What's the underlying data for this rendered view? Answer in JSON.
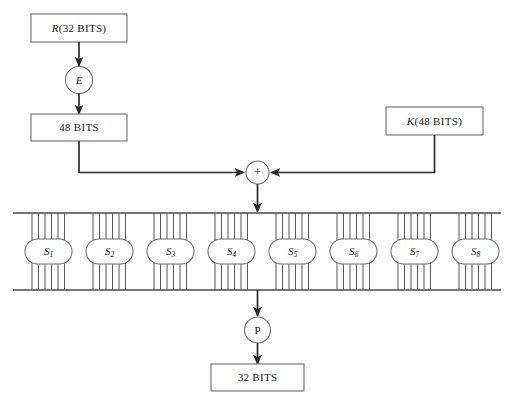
{
  "diagram": {
    "canvas": {
      "width": 516,
      "height": 406,
      "background": "#ffffff"
    },
    "colors": {
      "line": "#2b2b2b",
      "box_stroke": "#6d6d6d",
      "rail": "#4a4a4a",
      "bitline": "#5a5a5a",
      "text": "#1a1a1a",
      "background": "#ffffff"
    },
    "nodes": {
      "input_box": {
        "label": "R(32 BITS)",
        "label_italic_prefix": "R",
        "label_rest": "(32 BITS)",
        "shape": "rectangle"
      },
      "expansion": {
        "label": "E",
        "shape": "circle",
        "italic": true
      },
      "expanded_box": {
        "label": "48 BITS",
        "shape": "rectangle"
      },
      "key_box": {
        "label": "K(48 BITS)",
        "label_italic_prefix": "K",
        "label_rest": "(48 BITS)",
        "shape": "rectangle"
      },
      "xor": {
        "label": "+",
        "shape": "circle",
        "operation": "xor"
      },
      "permutation": {
        "label": "P",
        "shape": "circle"
      },
      "output_box": {
        "label": "32 BITS",
        "shape": "rectangle"
      }
    },
    "sboxes": {
      "count": 8,
      "input_bits_each": 6,
      "output_bits_each": 4,
      "items": [
        {
          "label": "S",
          "subscript": "1"
        },
        {
          "label": "S",
          "subscript": "2"
        },
        {
          "label": "S",
          "subscript": "3"
        },
        {
          "label": "S",
          "subscript": "4"
        },
        {
          "label": "S",
          "subscript": "5"
        },
        {
          "label": "S",
          "subscript": "6"
        },
        {
          "label": "S",
          "subscript": "7"
        },
        {
          "label": "S",
          "subscript": "8"
        }
      ]
    },
    "edges": [
      {
        "from": "input_box",
        "to": "expansion",
        "arrow": true
      },
      {
        "from": "expansion",
        "to": "expanded_box",
        "arrow": true
      },
      {
        "from": "expanded_box",
        "to": "xor",
        "arrow": true,
        "routing": "elbow-right"
      },
      {
        "from": "key_box",
        "to": "xor",
        "arrow": true,
        "routing": "elbow-left"
      },
      {
        "from": "xor",
        "to": "sbox_rail_top",
        "arrow": true
      },
      {
        "from": "sbox_rail_bottom",
        "to": "permutation",
        "arrow": true
      },
      {
        "from": "permutation",
        "to": "output_box",
        "arrow": true
      }
    ]
  }
}
